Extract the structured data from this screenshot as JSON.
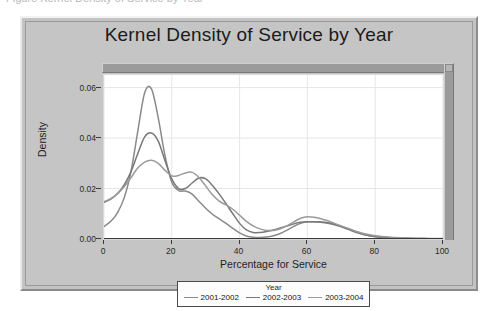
{
  "clipped_header_text": "Figure    Kernel Density of Service by Year",
  "figure": {
    "title": "Kernel Density of Service by Year"
  },
  "axes": {
    "ylabel": "Density",
    "xlabel": "Percentage for Service",
    "yticks": [
      "0.00",
      "0.02",
      "0.04",
      "0.06"
    ],
    "xticks": [
      "0",
      "20",
      "40",
      "60",
      "80",
      "100"
    ]
  },
  "legend": {
    "title": "Year",
    "position": "below-axis",
    "entries": [
      {
        "label": "2001-2002",
        "color": "#8a8a8a"
      },
      {
        "label": "2002-2003",
        "color": "#787878"
      },
      {
        "label": "2003-2004",
        "color": "#9a9a9a"
      }
    ]
  },
  "colors": {
    "figure_background": "#c5c5c5",
    "plot_background": "#ffffff",
    "gridline": "#e6e6e6",
    "axis": "#3a3a3a",
    "band": "#9b9b9b"
  },
  "chart_data": {
    "type": "line",
    "title": "Kernel Density of Service by Year",
    "xlabel": "Percentage for Service",
    "ylabel": "Density",
    "xlim": [
      0,
      100
    ],
    "ylim": [
      0.0,
      0.065
    ],
    "grid": true,
    "legend_position": "below-axis",
    "legend_title": "Year",
    "x": [
      0,
      2,
      4,
      6,
      8,
      10,
      12,
      14,
      16,
      18,
      20,
      22,
      24,
      26,
      28,
      30,
      32,
      34,
      36,
      38,
      40,
      42,
      44,
      46,
      48,
      50,
      52,
      54,
      56,
      58,
      60,
      62,
      64,
      66,
      68,
      70,
      72,
      74,
      76,
      78,
      80,
      82,
      84,
      86,
      88,
      90,
      92,
      94,
      96,
      98,
      100
    ],
    "series": [
      {
        "name": "2001-2002",
        "color": "#8a8a8a",
        "peak_x": 12,
        "peak_y": 0.06,
        "values": [
          0.005,
          0.007,
          0.0105,
          0.0165,
          0.027,
          0.043,
          0.058,
          0.0595,
          0.048,
          0.033,
          0.0225,
          0.0192,
          0.019,
          0.0178,
          0.015,
          0.0122,
          0.0098,
          0.008,
          0.0062,
          0.0042,
          0.0024,
          0.0012,
          0.0007,
          0.0006,
          0.0008,
          0.0013,
          0.0022,
          0.0035,
          0.005,
          0.0062,
          0.0068,
          0.0068,
          0.0066,
          0.0062,
          0.0056,
          0.0048,
          0.0038,
          0.0028,
          0.002,
          0.0014,
          0.0009,
          0.0006,
          0.0004,
          0.0003,
          0.0002,
          0.0002,
          0.0001,
          0.0001,
          0.0001,
          0.0001,
          0.0001
        ]
      },
      {
        "name": "2002-2003",
        "color": "#787878",
        "peak_x": 13,
        "peak_y": 0.042,
        "values": [
          0.0145,
          0.0158,
          0.018,
          0.0215,
          0.0268,
          0.034,
          0.0405,
          0.042,
          0.0388,
          0.031,
          0.0238,
          0.02,
          0.02,
          0.0222,
          0.0242,
          0.0238,
          0.0212,
          0.0178,
          0.014,
          0.01,
          0.0062,
          0.0036,
          0.0026,
          0.0026,
          0.003,
          0.0036,
          0.0044,
          0.0052,
          0.006,
          0.0066,
          0.0068,
          0.0068,
          0.0067,
          0.0064,
          0.0058,
          0.005,
          0.004,
          0.003,
          0.0021,
          0.0014,
          0.001,
          0.0007,
          0.0005,
          0.0004,
          0.0003,
          0.0002,
          0.0002,
          0.0002,
          0.0001,
          0.0001,
          0.0001
        ]
      },
      {
        "name": "2003-2004",
        "color": "#9a9a9a",
        "peak_x": 13,
        "peak_y": 0.031,
        "values": [
          0.0148,
          0.016,
          0.018,
          0.0208,
          0.0244,
          0.0282,
          0.0305,
          0.0312,
          0.03,
          0.0272,
          0.025,
          0.0252,
          0.0262,
          0.0264,
          0.0244,
          0.021,
          0.0175,
          0.015,
          0.0135,
          0.0118,
          0.0094,
          0.007,
          0.0052,
          0.004,
          0.0034,
          0.0034,
          0.004,
          0.0052,
          0.0068,
          0.0082,
          0.0088,
          0.0086,
          0.008,
          0.0072,
          0.0062,
          0.0052,
          0.0042,
          0.0032,
          0.0024,
          0.0018,
          0.0013,
          0.001,
          0.0008,
          0.0006,
          0.0005,
          0.0004,
          0.0003,
          0.0003,
          0.0002,
          0.0002,
          0.0002
        ]
      }
    ]
  }
}
